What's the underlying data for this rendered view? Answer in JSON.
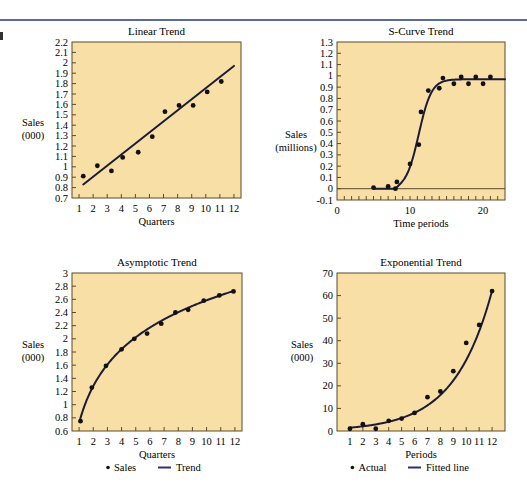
{
  "page": {
    "background": "#ffffff",
    "plot_background": "#f8dfa5",
    "frame_color": "#5b4a2a",
    "line_color": "#1e1a3a",
    "legend_line_color": "#2a2f7a",
    "header_rule_color": "#5a6a9a"
  },
  "chart_data": [
    {
      "id": "linear",
      "type": "scatter",
      "title": "Linear Trend",
      "xlabel": "Quarters",
      "ylabel": [
        "Sales",
        "(000)"
      ],
      "xlim": [
        0.5,
        12.5
      ],
      "ylim": [
        0.7,
        2.2
      ],
      "xticks": [
        1,
        2,
        3,
        4,
        5,
        6,
        7,
        8,
        9,
        10,
        11,
        12
      ],
      "xtick_labels": [
        "1",
        "2",
        "3",
        "4",
        "5",
        "6",
        "7",
        "8",
        "9",
        "10",
        "11",
        "12"
      ],
      "yticks": [
        0.7,
        0.8,
        0.9,
        1.0,
        1.1,
        1.2,
        1.3,
        1.4,
        1.5,
        1.6,
        1.7,
        1.8,
        1.9,
        2.0,
        2.1,
        2.2
      ],
      "ytick_labels": [
        "0.7",
        "0.8",
        "0.9",
        "1",
        "1.1",
        "1.2",
        "1.3",
        "1.4",
        "1.5",
        "1.6",
        "1.7",
        "1.8",
        "1.9",
        "2",
        "2.1",
        "2.2"
      ],
      "grid": false,
      "legend": null,
      "points": {
        "x": [
          1.3,
          2.3,
          3.3,
          4.1,
          5.2,
          6.2,
          7.1,
          8.1,
          9.1,
          10.1,
          11.1
        ],
        "y": [
          0.91,
          1.01,
          0.96,
          1.09,
          1.14,
          1.29,
          1.53,
          1.59,
          1.59,
          1.72,
          1.82
        ]
      },
      "trend": {
        "kind": "linear",
        "x": [
          1.3,
          12.0
        ],
        "y": [
          0.83,
          1.97
        ]
      }
    },
    {
      "id": "scurve",
      "type": "scatter",
      "title": "S-Curve Trend",
      "xlabel": "Time periods",
      "ylabel": [
        "Sales",
        "(millions)"
      ],
      "xlim": [
        0,
        23
      ],
      "ylim": [
        -0.1,
        1.3
      ],
      "xticks": [
        0,
        10,
        20
      ],
      "xtick_labels": [
        "0",
        "10",
        "20"
      ],
      "minor_xticks_step": 1,
      "yticks": [
        -0.1,
        0,
        0.1,
        0.2,
        0.3,
        0.4,
        0.5,
        0.6,
        0.7,
        0.8,
        0.9,
        1.0,
        1.1,
        1.2,
        1.3
      ],
      "ytick_labels": [
        "-0.1",
        "0",
        "0.1",
        "0.2",
        "0.3",
        "0.4",
        "0.5",
        "0.6",
        "0.7",
        "0.8",
        "0.9",
        "1",
        "1.1",
        "1.2",
        "1.3"
      ],
      "zero_line": true,
      "grid": false,
      "legend": null,
      "points": {
        "x": [
          5,
          7,
          8,
          8.2,
          10,
          11.2,
          11.5,
          12.5,
          14,
          14.5,
          16,
          17,
          18,
          19,
          20,
          21
        ],
        "y": [
          0.01,
          0.02,
          0.0,
          0.06,
          0.22,
          0.39,
          0.68,
          0.87,
          0.89,
          0.98,
          0.93,
          0.99,
          0.93,
          0.99,
          0.93,
          0.99
        ]
      },
      "trend": {
        "kind": "logistic",
        "x_start": 5,
        "x_end": 23,
        "plateau": 0.97,
        "midpoint": 11.2,
        "rate": 1.15,
        "flat_until": 8
      }
    },
    {
      "id": "asymptotic",
      "type": "scatter",
      "title": "Asymptotic Trend",
      "xlabel": "Quarters",
      "ylabel": [
        "Sales",
        "(000)"
      ],
      "xlim": [
        0.5,
        12.5
      ],
      "ylim": [
        0.6,
        3.0
      ],
      "xticks": [
        1,
        2,
        3,
        4,
        5,
        6,
        7,
        8,
        9,
        10,
        11,
        12
      ],
      "xtick_labels": [
        "1",
        "2",
        "3",
        "4",
        "5",
        "6",
        "7",
        "8",
        "9",
        "10",
        "11",
        "12"
      ],
      "yticks": [
        0.6,
        0.8,
        1.0,
        1.2,
        1.4,
        1.6,
        1.8,
        2.0,
        2.2,
        2.4,
        2.6,
        2.8,
        3.0
      ],
      "ytick_labels": [
        "0.6",
        "0.8",
        "1",
        "1.2",
        "1.4",
        "1.6",
        "1.8",
        "2",
        "2.2",
        "2.4",
        "2.6",
        "2.8",
        "3"
      ],
      "grid": false,
      "legend": {
        "position": "bottom",
        "entries": [
          {
            "marker": "dot",
            "label": "Sales"
          },
          {
            "marker": "line",
            "label": "Trend"
          }
        ]
      },
      "points": {
        "x": [
          1.1,
          1.9,
          2.9,
          4.0,
          4.9,
          5.8,
          6.8,
          7.8,
          8.7,
          9.8,
          10.9,
          11.9
        ],
        "y": [
          0.75,
          1.26,
          1.59,
          1.84,
          2.0,
          2.08,
          2.23,
          2.4,
          2.44,
          2.58,
          2.66,
          2.72
        ]
      },
      "trend": {
        "kind": "log",
        "a": 0.72,
        "b": 0.81,
        "x_start": 1.05,
        "x_end": 11.9
      }
    },
    {
      "id": "exponential",
      "type": "scatter",
      "title": "Exponential Trend",
      "xlabel": "Periods",
      "ylabel": [
        "Sales",
        "(000)"
      ],
      "xlim": [
        0,
        13
      ],
      "ylim": [
        0,
        70
      ],
      "xticks": [
        1,
        2,
        3,
        4,
        5,
        6,
        7,
        8,
        9,
        10,
        11,
        12
      ],
      "xtick_labels": [
        "1",
        "2",
        "3",
        "4",
        "5",
        "6",
        "7",
        "8",
        "9",
        "10",
        "11",
        "12"
      ],
      "yticks": [
        0,
        10,
        20,
        30,
        40,
        50,
        60,
        70
      ],
      "ytick_labels": [
        "0",
        "10",
        "20",
        "30",
        "40",
        "50",
        "60",
        "70"
      ],
      "grid": false,
      "legend": {
        "position": "bottom",
        "entries": [
          {
            "marker": "dot",
            "label": "Actual"
          },
          {
            "marker": "line",
            "label": "Fitted line"
          }
        ]
      },
      "points": {
        "x": [
          1,
          2,
          3,
          4,
          5,
          6,
          7,
          8,
          9,
          10,
          11,
          12
        ],
        "y": [
          1,
          3,
          1,
          4.5,
          5.5,
          8,
          15,
          17.5,
          26.5,
          39,
          47,
          62
        ]
      },
      "trend": {
        "kind": "exponential",
        "a": 1.05,
        "b": 0.34,
        "x_start": 1,
        "x_end": 12
      }
    }
  ]
}
